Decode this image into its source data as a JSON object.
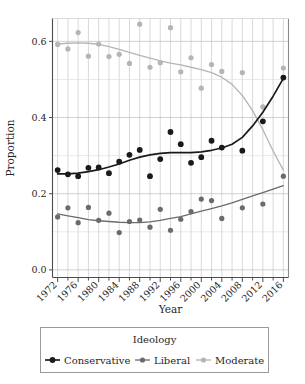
{
  "chart_data": {
    "type": "scatter",
    "title": "",
    "xlabel": "Year",
    "ylabel": "Proportion",
    "xlim": [
      1971,
      2017
    ],
    "ylim": [
      -0.02,
      0.66
    ],
    "grid": true,
    "legend_position": "bottom",
    "legend_title": "Ideology",
    "xticklabels": [
      "1972",
      "1976",
      "1980",
      "1984",
      "1988",
      "1992",
      "1996",
      "2000",
      "2004",
      "2008",
      "2012",
      "2016"
    ],
    "xtickvalues": [
      1972,
      1976,
      1980,
      1984,
      1988,
      1992,
      1996,
      2000,
      2004,
      2008,
      2012,
      2016
    ],
    "xminorticks": [
      1974,
      1978,
      1982,
      1986,
      1990,
      1994,
      1998,
      2002,
      2006,
      2010,
      2014
    ],
    "yticklabels": [
      "0.0",
      "0.2",
      "0.4",
      "0.6"
    ],
    "ytickvalues": [
      0.0,
      0.2,
      0.4,
      0.6
    ],
    "yminorgrid": [
      0.1,
      0.3,
      0.5
    ],
    "x": [
      1972,
      1974,
      1976,
      1978,
      1980,
      1982,
      1984,
      1986,
      1988,
      1990,
      1992,
      1994,
      1996,
      1998,
      2000,
      2002,
      2004,
      2008,
      2012,
      2016
    ],
    "series": [
      {
        "name": "Conservative",
        "color": "#1a1a1a",
        "marker": "circle",
        "values": [
          0.262,
          0.251,
          0.246,
          0.268,
          0.269,
          0.254,
          0.284,
          0.302,
          0.315,
          0.246,
          0.291,
          0.362,
          0.33,
          0.281,
          0.296,
          0.339,
          0.321,
          0.313,
          0.39,
          0.505
        ],
        "smooth": [
          [
            1972,
            0.252
          ],
          [
            1974,
            0.252
          ],
          [
            1976,
            0.254
          ],
          [
            1978,
            0.258
          ],
          [
            1980,
            0.263
          ],
          [
            1982,
            0.27
          ],
          [
            1984,
            0.278
          ],
          [
            1986,
            0.288
          ],
          [
            1988,
            0.296
          ],
          [
            1990,
            0.302
          ],
          [
            1992,
            0.306
          ],
          [
            1994,
            0.308
          ],
          [
            1996,
            0.308
          ],
          [
            1998,
            0.308
          ],
          [
            2000,
            0.31
          ],
          [
            2002,
            0.314
          ],
          [
            2004,
            0.32
          ],
          [
            2006,
            0.33
          ],
          [
            2008,
            0.348
          ],
          [
            2010,
            0.378
          ],
          [
            2012,
            0.414
          ],
          [
            2014,
            0.456
          ],
          [
            2016,
            0.503
          ]
        ]
      },
      {
        "name": "Liberal",
        "color": "#6b6b6b",
        "marker": "circle",
        "values": [
          0.139,
          0.163,
          0.124,
          0.164,
          0.13,
          0.149,
          0.098,
          0.127,
          0.131,
          0.112,
          0.159,
          0.104,
          0.133,
          0.153,
          0.186,
          0.182,
          0.135,
          0.163,
          0.173,
          0.246
        ],
        "smooth": [
          [
            1972,
            0.147
          ],
          [
            1974,
            0.142
          ],
          [
            1976,
            0.137
          ],
          [
            1978,
            0.132
          ],
          [
            1980,
            0.129
          ],
          [
            1982,
            0.127
          ],
          [
            1984,
            0.125
          ],
          [
            1986,
            0.124
          ],
          [
            1988,
            0.124
          ],
          [
            1990,
            0.126
          ],
          [
            1992,
            0.13
          ],
          [
            1994,
            0.135
          ],
          [
            1996,
            0.14
          ],
          [
            1998,
            0.147
          ],
          [
            2000,
            0.154
          ],
          [
            2002,
            0.161
          ],
          [
            2004,
            0.168
          ],
          [
            2006,
            0.176
          ],
          [
            2008,
            0.185
          ],
          [
            2010,
            0.194
          ],
          [
            2012,
            0.203
          ],
          [
            2014,
            0.212
          ],
          [
            2016,
            0.221
          ]
        ]
      },
      {
        "name": "Moderate",
        "color": "#b5b5b5",
        "marker": "circle",
        "values": [
          0.592,
          0.58,
          0.623,
          0.561,
          0.593,
          0.56,
          0.566,
          0.542,
          0.645,
          0.532,
          0.544,
          0.636,
          0.52,
          0.557,
          0.477,
          0.539,
          0.521,
          0.518,
          0.428,
          0.53
        ],
        "smooth": [
          [
            1972,
            0.593
          ],
          [
            1974,
            0.595
          ],
          [
            1976,
            0.596
          ],
          [
            1978,
            0.595
          ],
          [
            1980,
            0.592
          ],
          [
            1982,
            0.586
          ],
          [
            1984,
            0.579
          ],
          [
            1986,
            0.571
          ],
          [
            1988,
            0.563
          ],
          [
            1990,
            0.556
          ],
          [
            1992,
            0.549
          ],
          [
            1994,
            0.543
          ],
          [
            1996,
            0.538
          ],
          [
            1998,
            0.532
          ],
          [
            2000,
            0.526
          ],
          [
            2002,
            0.518
          ],
          [
            2004,
            0.506
          ],
          [
            2006,
            0.487
          ],
          [
            2008,
            0.458
          ],
          [
            2010,
            0.418
          ],
          [
            2012,
            0.368
          ],
          [
            2014,
            0.312
          ],
          [
            2016,
            0.262
          ]
        ]
      }
    ]
  },
  "legend": {
    "title": "Ideology",
    "entries": [
      {
        "label": "Conservative",
        "color": "#1a1a1a"
      },
      {
        "label": "Liberal",
        "color": "#6b6b6b"
      },
      {
        "label": "Moderate",
        "color": "#b5b5b5"
      }
    ]
  },
  "axes": {
    "x_title": "Year",
    "y_title": "Proportion"
  }
}
